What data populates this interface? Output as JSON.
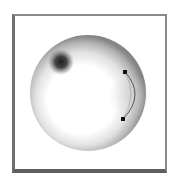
{
  "diagram": {
    "frame": {
      "x": 12,
      "y": 14,
      "width": 155,
      "height": 159,
      "border_color": "#7a7a7a"
    },
    "sphere": {
      "cx": 88,
      "cy": 93,
      "r": 58,
      "highlight_cx": 83,
      "highlight_cy": 98,
      "highlight_color": "#ffffff",
      "edge_color": "#7f7f7f"
    },
    "dark_spot": {
      "cx": 61,
      "cy": 62,
      "r": 12,
      "color": "#1e1e1e"
    },
    "arc": {
      "start": {
        "x": 125,
        "y": 72
      },
      "end": {
        "x": 123,
        "y": 119
      },
      "control": {
        "x": 146,
        "y": 95
      },
      "stroke_color": "#555555"
    },
    "handles": [
      {
        "x": 125,
        "y": 72,
        "size": 4,
        "color": "#111111"
      },
      {
        "x": 123,
        "y": 119,
        "size": 4,
        "color": "#111111"
      }
    ]
  }
}
